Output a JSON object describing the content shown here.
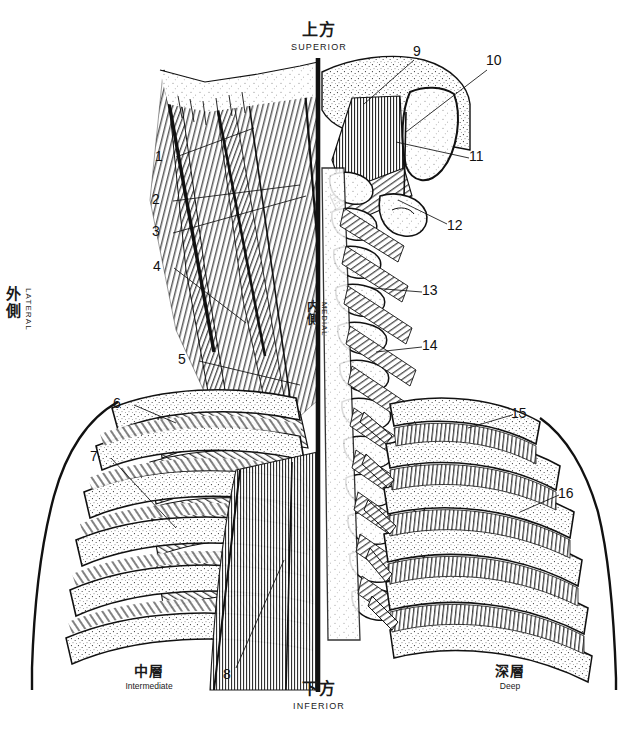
{
  "figure": {
    "background": "#ffffff",
    "ink": "#111111"
  },
  "orientation": {
    "superior": {
      "jp": "上方",
      "en": "SUPERIOR"
    },
    "inferior": {
      "jp": "下方",
      "en": "INFERIOR"
    },
    "lateral": {
      "jp": "外側",
      "en": "LATERAL"
    },
    "medial": {
      "jp": "内側",
      "en": "MEDIAL"
    }
  },
  "layers": {
    "intermediate": {
      "jp": "中層",
      "en": "Intermediate"
    },
    "deep": {
      "jp": "深層",
      "en": "Deep"
    }
  },
  "callouts": [
    {
      "n": "1",
      "x": 160,
      "y": 157
    },
    {
      "n": "2",
      "x": 157,
      "y": 200
    },
    {
      "n": "3",
      "x": 157,
      "y": 232
    },
    {
      "n": "4",
      "x": 158,
      "y": 267
    },
    {
      "n": "5",
      "x": 183,
      "y": 360
    },
    {
      "n": "6",
      "x": 118,
      "y": 404
    },
    {
      "n": "7",
      "x": 95,
      "y": 457
    },
    {
      "n": "8",
      "x": 228,
      "y": 675
    },
    {
      "n": "9",
      "x": 418,
      "y": 52
    },
    {
      "n": "10",
      "x": 491,
      "y": 61
    },
    {
      "n": "11",
      "x": 474,
      "y": 157
    },
    {
      "n": "12",
      "x": 452,
      "y": 226
    },
    {
      "n": "13",
      "x": 427,
      "y": 291
    },
    {
      "n": "14",
      "x": 427,
      "y": 346
    },
    {
      "n": "15",
      "x": 516,
      "y": 414
    },
    {
      "n": "16",
      "x": 563,
      "y": 494
    }
  ]
}
